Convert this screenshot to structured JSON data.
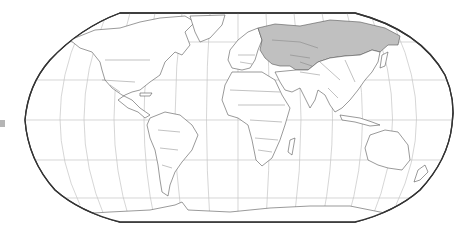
{
  "map": {
    "projection": "Robinson",
    "style": "world political outline map with graticule",
    "highlight_color": "#c0c0c0",
    "land_color": "#ffffff",
    "ocean_color": "#ffffff",
    "border_color": "#555555",
    "frame_color": "#333333",
    "graticule_color": "#c4c4c4",
    "highlighted_region": "Former Soviet Union countries",
    "highlighted_countries": [
      "Russia",
      "Ukraine",
      "Belarus",
      "Estonia",
      "Latvia",
      "Lithuania",
      "Moldova",
      "Kazakhstan",
      "Uzbekistan",
      "Turkmenistan",
      "Kyrgyzstan",
      "Tajikistan",
      "Georgia",
      "Armenia",
      "Azerbaijan"
    ],
    "continents": [
      "North America",
      "South America",
      "Europe",
      "Africa",
      "Asia",
      "Australia",
      "Antarctica"
    ],
    "labels": []
  },
  "edge_marker": {
    "color": "#b5b5b5"
  }
}
